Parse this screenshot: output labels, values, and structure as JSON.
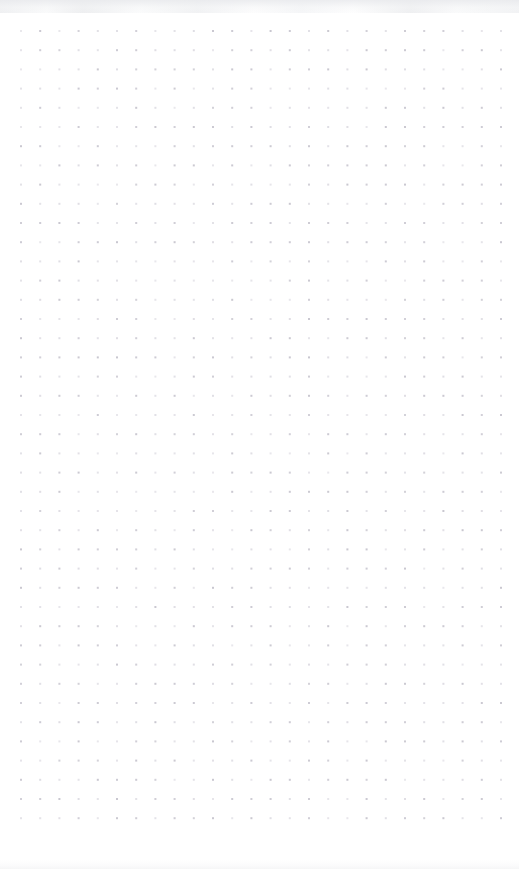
{
  "page": {
    "kind": "dot-grid-notebook-page",
    "width_px": 519,
    "height_px": 869,
    "background_color": "#ffffff",
    "paper_tint": "#fdfdfe",
    "scan_edge_color": "#eef0f1",
    "content_text": "",
    "notes_text": "",
    "handwriting_text": ""
  },
  "grid": {
    "dot_color": "#c9c7d0",
    "dot_color_soft": "#d7d5dd",
    "dot_diameter_px": 2,
    "spacing_px": 19.2,
    "origin_x_px": 21,
    "origin_y_px": 31,
    "columns": 26,
    "rows": 42,
    "total_dots": 1092,
    "pattern": "square-dot-lattice"
  },
  "margins": {
    "left_px": 21,
    "right_px": 19,
    "top_px": 31,
    "bottom_px": 39
  }
}
